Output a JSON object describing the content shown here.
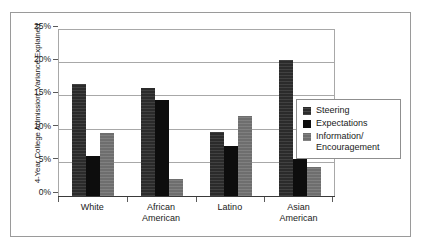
{
  "chart_data": {
    "type": "bar",
    "title": "",
    "xlabel": "",
    "ylabel": "4-Year College Admission: Variance Explained",
    "categories": [
      "White",
      "African American",
      "Latino",
      "Asian American"
    ],
    "category_lines": [
      [
        "White"
      ],
      [
        "African",
        "American"
      ],
      [
        "Latino"
      ],
      [
        "Asian",
        "American"
      ]
    ],
    "series": [
      {
        "name": "Steering",
        "values": [
          16.8,
          16.3,
          9.6,
          20.5
        ],
        "color": "#2b2b2b"
      },
      {
        "name": "Expectations",
        "values": [
          6.0,
          14.4,
          7.5,
          5.6
        ],
        "color": "#0d0d0d"
      },
      {
        "name": "Information/ Encouragement",
        "name_lines": [
          "Information/",
          "Encouragement"
        ],
        "values": [
          9.5,
          2.6,
          12.1,
          4.4
        ],
        "color": "#6e6e6e"
      }
    ],
    "ylim": [
      0,
      25
    ],
    "ytick_values": [
      0,
      5,
      10,
      15,
      20,
      25
    ],
    "ytick_labels": [
      "0%",
      "5%",
      "10%",
      "15%",
      "20%",
      "25%"
    ],
    "grid": true,
    "legend_position": "right"
  }
}
